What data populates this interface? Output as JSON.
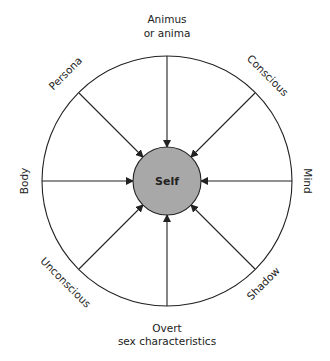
{
  "diagram": {
    "center": {
      "label": "Self",
      "fill": "#a8a8a8"
    },
    "nodes": [
      {
        "id": "top",
        "lines": [
          "Animus",
          "or anima"
        ]
      },
      {
        "id": "top-right",
        "lines": [
          "Conscious"
        ]
      },
      {
        "id": "right",
        "lines": [
          "Mind"
        ]
      },
      {
        "id": "bottom-right",
        "lines": [
          "Shadow"
        ]
      },
      {
        "id": "bottom",
        "lines": [
          "Overt",
          "sex characteristics"
        ]
      },
      {
        "id": "bottom-left",
        "lines": [
          "Unconscious"
        ]
      },
      {
        "id": "left",
        "lines": [
          "Body"
        ]
      },
      {
        "id": "top-left",
        "lines": [
          "Persona"
        ]
      }
    ],
    "stroke_color": "#222222"
  }
}
